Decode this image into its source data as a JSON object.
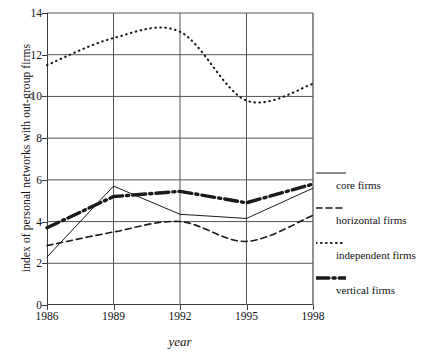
{
  "chart_data": {
    "type": "line",
    "title": "",
    "xlabel": "year",
    "ylabel": "index of personal networks with out-group firms",
    "x": [
      1986,
      1989,
      1992,
      1995,
      1998
    ],
    "xtick_labels": [
      "1986",
      "1989",
      "1992",
      "1995",
      "1998"
    ],
    "ytick_labels": [
      "0",
      "2",
      "4",
      "6",
      "8",
      "10",
      "12",
      "14"
    ],
    "ytick_values": [
      0,
      2,
      4,
      6,
      8,
      10,
      12,
      14
    ],
    "xlim": [
      1986,
      1998
    ],
    "ylim": [
      0,
      14
    ],
    "grid": "both",
    "legend_position": "right",
    "series": [
      {
        "name": "core firms",
        "style": "thin-solid",
        "values": [
          2.3,
          5.7,
          4.35,
          4.15,
          5.6
        ]
      },
      {
        "name": "horizontal firms",
        "style": "dashed",
        "values": [
          2.85,
          3.5,
          4.0,
          3.05,
          4.3
        ]
      },
      {
        "name": "independent firms",
        "style": "dotted",
        "values": [
          11.5,
          12.8,
          13.1,
          9.8,
          10.6
        ]
      },
      {
        "name": "vertical firms",
        "style": "thick-dash-dot",
        "values": [
          3.7,
          5.2,
          5.45,
          4.9,
          5.8
        ]
      }
    ]
  },
  "legend": {
    "entries": [
      {
        "label": "core firms",
        "style": "thin-solid"
      },
      {
        "label": "horizontal firms",
        "style": "dashed"
      },
      {
        "label": "independent firms",
        "style": "dotted"
      },
      {
        "label": "vertical firms",
        "style": "thick-dash-dot"
      }
    ]
  },
  "colors": {
    "ink": "#1a1a1a",
    "axis": "#3a3a3a",
    "grid": "#555555",
    "background": "#ffffff"
  }
}
